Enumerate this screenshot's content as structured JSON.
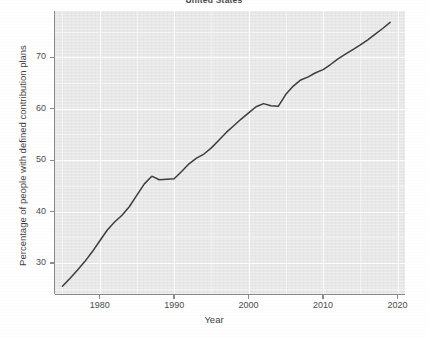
{
  "title": "United States",
  "axis": {
    "x_title": "Year",
    "y_title": "Percentage of people with defined contribution plans",
    "x_ticks": [
      "1980",
      "1990",
      "2000",
      "2010",
      "2020"
    ],
    "y_ticks": [
      "30",
      "40",
      "50",
      "60",
      "70"
    ]
  },
  "chart_data": {
    "type": "line",
    "title": "United States",
    "xlabel": "Year",
    "ylabel": "Percentage of people with defined contribution plans",
    "xlim": [
      1974,
      2021
    ],
    "ylim": [
      24,
      79
    ],
    "grid": true,
    "legend": "none",
    "line_color": "#3d3d3d",
    "panel_color": "#e9e9e9",
    "gridline_color": "#ffffff",
    "x_tick_values": [
      1980,
      1990,
      2000,
      2010,
      2020
    ],
    "y_tick_values": [
      30,
      40,
      50,
      60,
      70
    ],
    "series": [
      {
        "name": "Percentage of people with defined contribution plans",
        "x": [
          1975,
          1976,
          1977,
          1978,
          1979,
          1980,
          1981,
          1982,
          1983,
          1984,
          1985,
          1986,
          1987,
          1988,
          1989,
          1990,
          1991,
          1992,
          1993,
          1994,
          1995,
          1996,
          1997,
          1998,
          1999,
          2000,
          2001,
          2002,
          2003,
          2004,
          2005,
          2006,
          2007,
          2008,
          2009,
          2010,
          2011,
          2012,
          2013,
          2014,
          2015,
          2016,
          2017,
          2018,
          2019
        ],
        "y": [
          25.5,
          27.0,
          28.6,
          30.3,
          32.2,
          34.3,
          36.4,
          38.0,
          39.3,
          41.0,
          43.2,
          45.4,
          46.9,
          46.2,
          46.3,
          46.4,
          47.8,
          49.3,
          50.4,
          51.2,
          52.4,
          53.9,
          55.4,
          56.7,
          58.0,
          59.2,
          60.4,
          61.0,
          60.6,
          60.5,
          62.8,
          64.4,
          65.6,
          66.2,
          67.0,
          67.6,
          68.6,
          69.7,
          70.6,
          71.5,
          72.4,
          73.4,
          74.5,
          75.6,
          76.8
        ]
      }
    ]
  }
}
